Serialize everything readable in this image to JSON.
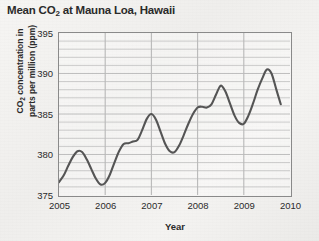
{
  "chart_data": {
    "type": "line",
    "title": "Mean CO2 at Mauna Loa, Hawaii",
    "title_parts": {
      "pre": "Mean CO",
      "sub": "2",
      "post": " at Mauna Loa, Hawaii"
    },
    "xlabel": "Year",
    "ylabel": "CO2 concentration in parts per million (ppm)",
    "ylabel_line1_pre": "CO",
    "ylabel_line1_sub": "2",
    "ylabel_line1_post": " concentration in",
    "ylabel_line2": "parts per million (ppm)",
    "xlim": [
      2005,
      2010
    ],
    "ylim": [
      375,
      395
    ],
    "xticks": [
      "2005",
      "2006",
      "2007",
      "2008",
      "2009",
      "2010"
    ],
    "xtick_values": [
      2005,
      2006,
      2007,
      2008,
      2009,
      2010
    ],
    "yticks": [
      "375",
      "380",
      "385",
      "390",
      "395"
    ],
    "ytick_values": [
      375,
      380,
      385,
      390,
      395
    ],
    "grid": "major vertical at each year, horizontal every 1 ppm",
    "minor_y_step": 1,
    "legend": "none",
    "line_color": "#555555",
    "grid_color": "#b9b9b9",
    "axis_color": "#8a8a8a",
    "series": [
      {
        "name": "Mean CO2 concentration",
        "x": [
          2005.0,
          2005.1,
          2005.2,
          2005.3,
          2005.4,
          2005.5,
          2005.6,
          2005.7,
          2005.8,
          2005.9,
          2006.0,
          2006.1,
          2006.2,
          2006.3,
          2006.4,
          2006.5,
          2006.6,
          2006.7,
          2006.8,
          2006.9,
          2007.0,
          2007.1,
          2007.2,
          2007.3,
          2007.4,
          2007.5,
          2007.6,
          2007.7,
          2007.8,
          2007.9,
          2008.0,
          2008.1,
          2008.2,
          2008.3,
          2008.4,
          2008.5,
          2008.6,
          2008.7,
          2008.8,
          2008.9,
          2009.0,
          2009.1,
          2009.2,
          2009.3,
          2009.4,
          2009.5,
          2009.6,
          2009.7,
          2009.8
        ],
        "y": [
          376.6,
          377.4,
          378.6,
          379.7,
          380.4,
          380.3,
          379.4,
          378.2,
          377.0,
          376.3,
          376.5,
          377.5,
          379.0,
          380.4,
          381.3,
          381.4,
          381.6,
          381.8,
          383.0,
          384.4,
          385.0,
          384.3,
          382.8,
          381.3,
          380.4,
          380.3,
          381.1,
          382.4,
          383.8,
          385.0,
          385.8,
          385.9,
          385.8,
          386.2,
          387.4,
          388.5,
          387.8,
          386.3,
          384.8,
          383.9,
          383.8,
          384.8,
          386.3,
          388.0,
          389.4,
          390.5,
          390.0,
          388.1,
          386.2
        ]
      }
    ]
  }
}
